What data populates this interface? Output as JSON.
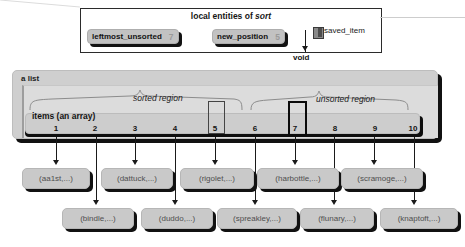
{
  "locals_panel": {
    "title_prefix": "local entities of ",
    "title_italic": "sort",
    "variables": [
      {
        "name": "leftmost_unsorted",
        "value": "7"
      },
      {
        "name": "new_position",
        "value": "5"
      }
    ],
    "pointer": {
      "label": "saved_item",
      "target": "void",
      "icon": "value-swatch-icon"
    }
  },
  "list_object": {
    "label": "a list",
    "array_label": "items (an array)",
    "indices": [
      "1",
      "2",
      "3",
      "4",
      "5",
      "6",
      "7",
      "8",
      "9",
      "10"
    ],
    "regions": [
      {
        "label": "sorted region",
        "from": 1,
        "to": 6
      },
      {
        "label": "unsorted region",
        "from": 7,
        "to": 10
      }
    ],
    "highlighted_slots": [
      "5",
      "7"
    ]
  },
  "items": [
    {
      "index": 1,
      "text": "(aa1st,...)",
      "row": "top"
    },
    {
      "index": 2,
      "text": "(bindle,...)",
      "row": "bottom"
    },
    {
      "index": 3,
      "text": "(dattuck,...)",
      "row": "top"
    },
    {
      "index": 4,
      "text": "(duddo,...)",
      "row": "bottom"
    },
    {
      "index": 5,
      "text": "(rigolet,...)",
      "row": "top"
    },
    {
      "index": 6,
      "text": "(spreakley,...)",
      "row": "bottom"
    },
    {
      "index": 7,
      "text": "(harbottle,...)",
      "row": "top"
    },
    {
      "index": 8,
      "text": "(flunary,...)",
      "row": "bottom"
    },
    {
      "index": 9,
      "text": "(scramoge,...)",
      "row": "top"
    },
    {
      "index": 10,
      "text": "(knaptoft,...)",
      "row": "bottom"
    }
  ],
  "colors": {
    "chip_face": "#c9c9c9",
    "chip_shadow": "#111111",
    "panel_border": "#2b2b2b",
    "list_face": "#cfcfcf",
    "list_inner": "#dcdcdc",
    "ink": "#131313",
    "muted_text": "#4f4f4f"
  }
}
